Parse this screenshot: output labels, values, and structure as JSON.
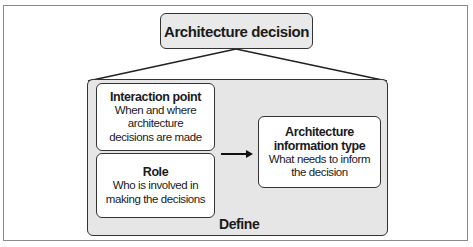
{
  "diagram": {
    "top_node": {
      "label": "Architecture decision"
    },
    "container": {
      "label": "Define"
    },
    "nodes": [
      {
        "id": "interaction-point",
        "title": "Interaction point",
        "description": "When and where architecture decisions are made"
      },
      {
        "id": "role",
        "title": "Role",
        "description": "Who is involved in making the decisions"
      },
      {
        "id": "information-type",
        "title": "Architecture information type",
        "description": "What needs to inform the decision"
      }
    ],
    "edges": [
      {
        "from": "top_node",
        "to": "container",
        "type": "bracket-lines"
      },
      {
        "from": "interaction-point+role",
        "to": "information-type",
        "type": "arrow"
      }
    ],
    "colors": {
      "node_fill": "#ffffff",
      "container_fill": "#e6e6e6",
      "top_node_fill": "#e9e9e9",
      "stroke": "#333333"
    }
  }
}
